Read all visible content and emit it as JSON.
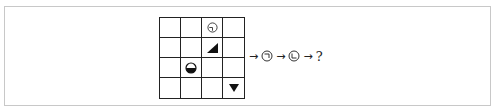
{
  "puzzle": {
    "grid": {
      "rows": 4,
      "cols": 4,
      "cells": [
        {
          "row": 0,
          "col": 2,
          "symbol": "circle-with-notch-bottom-left"
        },
        {
          "row": 1,
          "col": 2,
          "symbol": "black-right-triangle"
        },
        {
          "row": 2,
          "col": 1,
          "symbol": "half-filled-circle-bottom"
        },
        {
          "row": 3,
          "col": 3,
          "symbol": "black-down-triangle"
        }
      ]
    },
    "sequence": {
      "arrow": "→",
      "items": [
        {
          "symbol": "circle-with-corner-top-right"
        },
        {
          "symbol": "circle-with-corner-bottom-left"
        }
      ],
      "question": "?"
    }
  }
}
